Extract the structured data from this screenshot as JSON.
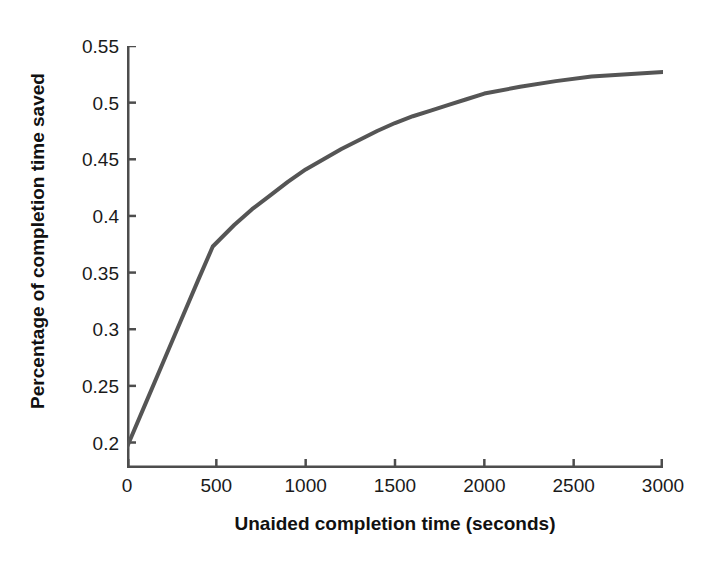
{
  "chart_data": {
    "type": "line",
    "title": "",
    "xlabel": "Unaided completion time (seconds)",
    "ylabel": "Percentage of completion time saved",
    "xlim": [
      0,
      3000
    ],
    "ylim": [
      0.1775,
      0.55
    ],
    "grid": false,
    "legend": null,
    "line_color": "#555555",
    "line_width": 4,
    "xticks": [
      0,
      500,
      1000,
      1500,
      2000,
      2500,
      3000
    ],
    "xticklabels": [
      "0",
      "500",
      "1000",
      "1500",
      "2000",
      "2500",
      "3000"
    ],
    "yticks": [
      0.2,
      0.25,
      0.3,
      0.35,
      0.4,
      0.45,
      0.5,
      0.55
    ],
    "yticklabels": [
      "0.2",
      "0.25",
      "0.3",
      "0.35",
      "0.4",
      "0.45",
      "0.5",
      "0.55"
    ],
    "series": [
      {
        "name": "percentage of completion time saved",
        "x": [
          0,
          100,
          200,
          300,
          400,
          480,
          600,
          700,
          800,
          900,
          1000,
          1100,
          1200,
          1300,
          1400,
          1500,
          1600,
          1700,
          1800,
          1900,
          2000,
          2200,
          2400,
          2600,
          2800,
          3000
        ],
        "values": [
          0.196,
          0.233,
          0.27,
          0.307,
          0.344,
          0.373,
          0.392,
          0.406,
          0.418,
          0.43,
          0.441,
          0.45,
          0.459,
          0.467,
          0.475,
          0.482,
          0.488,
          0.493,
          0.498,
          0.503,
          0.508,
          0.514,
          0.519,
          0.523,
          0.525,
          0.527
        ]
      }
    ]
  },
  "axes": {
    "frame_color": "#4d4d4d"
  }
}
